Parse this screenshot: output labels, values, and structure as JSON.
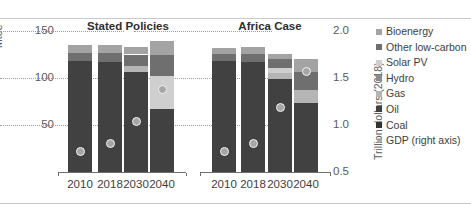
{
  "figure": {
    "clipped_title": "",
    "left_axis_title": "Mtoe",
    "right_axis_title": "Trillion dollars (2018)"
  },
  "groups": [
    {
      "label": "Stated Policies"
    },
    {
      "label": "Africa Case"
    }
  ],
  "legend": {
    "items": [
      {
        "label": "Bioenergy",
        "color": "#a3a3a3",
        "marker": "square"
      },
      {
        "label": "Other low-carbon",
        "color": "#6f6f6f",
        "marker": "square"
      },
      {
        "label": "Solar PV",
        "color": "#cfcfcf",
        "marker": "square"
      },
      {
        "label": "Hydro",
        "color": "#8c8c8c",
        "marker": "square"
      },
      {
        "label": "Gas",
        "color": "#b5b5b5",
        "marker": "square"
      },
      {
        "label": "Oil",
        "color": "#414141",
        "marker": "square"
      },
      {
        "label": "Coal",
        "color": "#333333",
        "marker": "square"
      },
      {
        "label": "GDP (right axis)",
        "color": "#a6a6a6",
        "marker": "circle"
      }
    ]
  },
  "chart_data": {
    "type": "bar",
    "title": "",
    "subtitle": "",
    "stacked": true,
    "xlabel": "",
    "ylabel": "Mtoe",
    "y2label": "Trillion dollars (2018)",
    "ylim": [
      0,
      150
    ],
    "yticks": [
      50,
      100,
      150
    ],
    "ytick_labels": [
      "50",
      "100",
      "150"
    ],
    "y2lim": [
      0.25,
      2.0
    ],
    "y2ticks": [
      0.5,
      1.0,
      1.5,
      2.0
    ],
    "y2tick_labels": [
      "0.5",
      "1.0",
      "1.5",
      "2.0"
    ],
    "grid": true,
    "legend_position": "right",
    "categories": [
      "2010",
      "2018",
      "2030",
      "2040",
      "2010",
      "2018",
      "2030",
      "2040"
    ],
    "group_of_category": [
      "Stated Policies",
      "Stated Policies",
      "Stated Policies",
      "Stated Policies",
      "Africa Case",
      "Africa Case",
      "Africa Case",
      "Africa Case"
    ],
    "series": [
      {
        "name": "Coal",
        "color": "#333333",
        "values": [
          0,
          0,
          0,
          0,
          0,
          0,
          0,
          0
        ]
      },
      {
        "name": "Oil",
        "color": "#414141",
        "values": [
          118,
          117,
          106,
          67,
          118,
          117,
          99,
          73
        ]
      },
      {
        "name": "Gas",
        "color": "#b5b5b5",
        "values": [
          0,
          0,
          7,
          0,
          0,
          0,
          6,
          14
        ]
      },
      {
        "name": "Hydro",
        "color": "#8c8c8c",
        "values": [
          0,
          0,
          0,
          0,
          0,
          0,
          0,
          0
        ]
      },
      {
        "name": "Solar PV",
        "color": "#cfcfcf",
        "values": [
          0,
          0,
          0,
          35,
          0,
          0,
          6,
          0
        ]
      },
      {
        "name": "Other low-carbon",
        "color": "#6f6f6f",
        "values": [
          9,
          10,
          12,
          22,
          8,
          9,
          9,
          19
        ]
      },
      {
        "name": "Bioenergy",
        "color": "#a3a3a3",
        "values": [
          8,
          8,
          8,
          15,
          6,
          7,
          6,
          14
        ]
      }
    ],
    "totals": [
      135,
      135,
      133,
      139,
      132,
      133,
      126,
      120
    ],
    "gdp_series": {
      "name": "GDP (right axis)",
      "axis": "right",
      "marker": "circle",
      "color": "#a6a6a6",
      "values": [
        0.72,
        0.8,
        1.04,
        1.38,
        0.72,
        0.8,
        1.19,
        1.57
      ]
    }
  }
}
